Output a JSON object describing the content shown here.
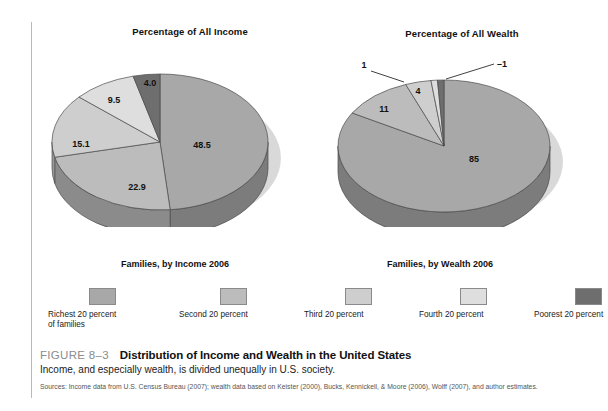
{
  "figure": {
    "number": "FIGURE 8–3",
    "title": "Distribution of Income and Wealth in the United States",
    "subtitle": "Income, and especially wealth, is divided unequally in U.S. society.",
    "sources": "Sources: Income data from U.S. Census Bureau (2007); wealth data based on Keister (2000), Bucks, Kennickell, & Moore (2006), Wolff (2007), and author estimates."
  },
  "legend": {
    "head_income": "Families, by Income\n2006",
    "head_wealth": "Families, by Wealth\n2006",
    "items": [
      {
        "label": "Richest 20 percent\nof families",
        "color": "#a8a8a8"
      },
      {
        "label": "Second 20 percent",
        "color": "#bcbcbc"
      },
      {
        "label": "Third 20 percent",
        "color": "#cecece"
      },
      {
        "label": "Fourth 20 percent",
        "color": "#dedede"
      },
      {
        "label": "Poorest 20 percent",
        "color": "#6e6e6e"
      }
    ]
  },
  "chart_data": [
    {
      "type": "pie",
      "title": "Percentage of All Income",
      "categories": [
        "Richest 20 percent of families",
        "Second 20 percent",
        "Third 20 percent",
        "Fourth 20 percent",
        "Poorest 20 percent"
      ],
      "values": [
        48.5,
        22.9,
        15.1,
        9.5,
        4.0
      ],
      "labels": [
        "48.5",
        "22.9",
        "15.1",
        "9.5",
        "4.0"
      ],
      "colors": [
        "#a8a8a8",
        "#bcbcbc",
        "#cecece",
        "#dedede",
        "#6e6e6e"
      ],
      "units": "percent",
      "legend_position": "bottom"
    },
    {
      "type": "pie",
      "title": "Percentage of All Wealth",
      "categories": [
        "Richest 20 percent of families",
        "Second 20 percent",
        "Third 20 percent",
        "Fourth 20 percent",
        "Poorest 20 percent"
      ],
      "values": [
        85,
        11,
        4,
        1,
        -1
      ],
      "labels": [
        "85",
        "11",
        "4",
        "1",
        "–1"
      ],
      "colors": [
        "#a8a8a8",
        "#bcbcbc",
        "#cecece",
        "#dedede",
        "#6e6e6e"
      ],
      "units": "percent",
      "legend_position": "bottom"
    }
  ]
}
